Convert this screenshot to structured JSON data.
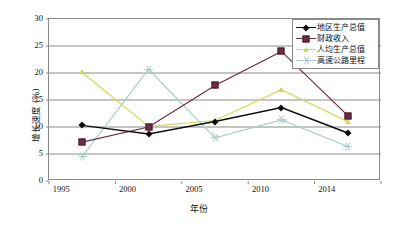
{
  "chart_data": {
    "type": "line",
    "title": "",
    "xlabel": "年份",
    "ylabel": "增长速度 (%)",
    "categories": [
      "1995",
      "2000",
      "2005",
      "2010",
      "2014"
    ],
    "x_ticks": [
      "1995",
      "2000",
      "2005",
      "2010",
      "2014"
    ],
    "y_ticks": [
      "0",
      "5",
      "10",
      "15",
      "20",
      "25",
      "30"
    ],
    "ylim": [
      0,
      30
    ],
    "y_tick_step": 5,
    "grid": "horizontal",
    "legend_position": "top-right",
    "series": [
      {
        "name": "地区生产总值",
        "marker": "diamond",
        "color": "#0d0d0d",
        "values": [
          10.3,
          8.7,
          11.0,
          13.6,
          8.9
        ]
      },
      {
        "name": "财政收入",
        "marker": "square",
        "color": "#6e2b45",
        "values": [
          7.2,
          10.0,
          17.7,
          24.0,
          12.1
        ]
      },
      {
        "name": "人均生产总值",
        "marker": "triangle",
        "color": "#d2d957",
        "values": [
          20.1,
          10.1,
          11.2,
          16.9,
          11.0
        ]
      },
      {
        "name": "高速公路里程",
        "marker": "star",
        "color": "#a7cfcb",
        "values": [
          4.5,
          20.7,
          8.0,
          11.3,
          6.4
        ]
      }
    ]
  },
  "axes": {
    "y_title": "增长速度 (%)",
    "x_title": "年份"
  },
  "colors": {
    "frame": "#8a8a8a",
    "grid": "#8a8a8a",
    "background": "#ffffff"
  }
}
